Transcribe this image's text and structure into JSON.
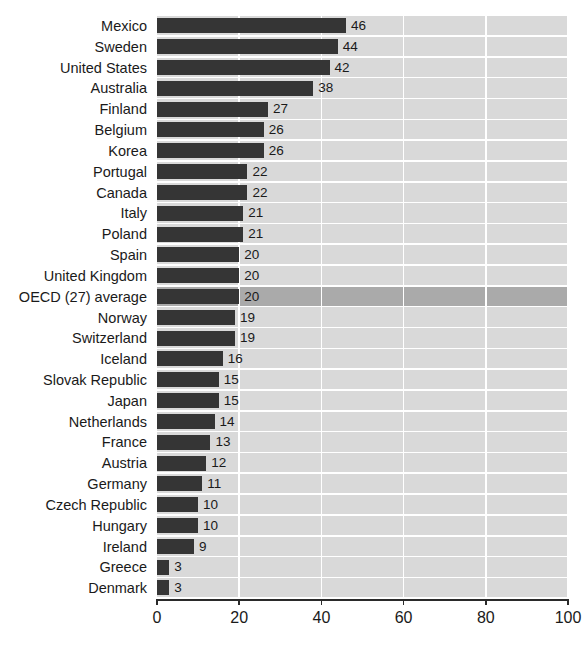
{
  "chart_data": {
    "type": "bar",
    "orientation": "horizontal",
    "title": "",
    "xlabel": "",
    "ylabel": "",
    "xlim": [
      0,
      100
    ],
    "xticks": [
      "0",
      "20",
      "40",
      "60",
      "80",
      "100"
    ],
    "grid": true,
    "legend": "none",
    "highlight_category": "OECD (27) average",
    "colors": {
      "bar": "#353535",
      "plot_background": "#d9d9d9",
      "highlight_band": "#aaaaaa",
      "gridline": "#ffffff",
      "text": "#1a1a1a",
      "axis": "#2a2a2a"
    },
    "categories": [
      "Mexico",
      "Sweden",
      "United States",
      "Australia",
      "Finland",
      "Belgium",
      "Korea",
      "Portugal",
      "Canada",
      "Italy",
      "Poland",
      "Spain",
      "United Kingdom",
      "OECD (27) average",
      "Norway",
      "Switzerland",
      "Iceland",
      "Slovak Republic",
      "Japan",
      "Netherlands",
      "France",
      "Austria",
      "Germany",
      "Czech Republic",
      "Hungary",
      "Ireland",
      "Greece",
      "Denmark"
    ],
    "values": [
      46,
      44,
      42,
      38,
      27,
      26,
      26,
      22,
      22,
      21,
      21,
      20,
      20,
      20,
      19,
      19,
      16,
      15,
      15,
      14,
      13,
      12,
      11,
      10,
      10,
      9,
      3,
      3
    ]
  }
}
